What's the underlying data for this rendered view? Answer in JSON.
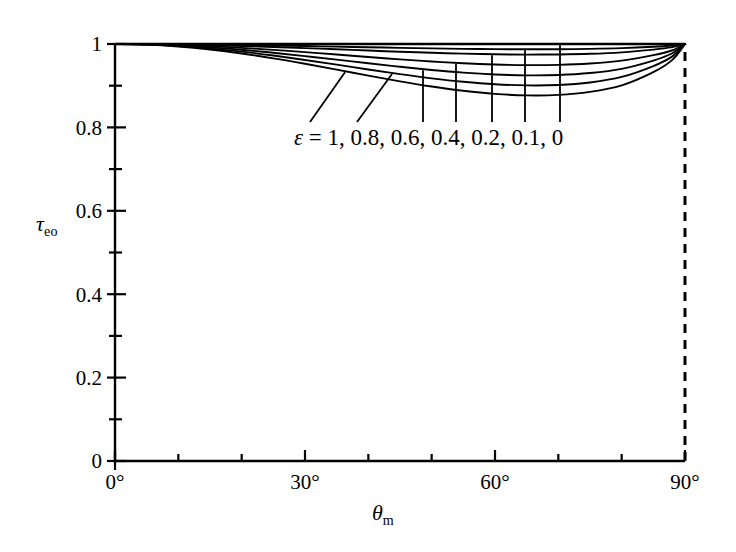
{
  "chart_data": {
    "type": "line",
    "title": "",
    "xlabel": "θ_m",
    "ylabel": "τ_eo",
    "xlabel_display": "θ",
    "xlabel_sub": "m",
    "ylabel_display": "τ",
    "ylabel_sub": "eo",
    "xlim": [
      0,
      90
    ],
    "ylim": [
      0,
      1
    ],
    "x_unit": "degrees",
    "grid": false,
    "legend_position": "inside-below-curves",
    "legend_text": "ε = 1, 0.8, 0.6, 0.4, 0.2, 0.1, 0",
    "legend_symbol": "ε",
    "legend_equals": " = ",
    "legend_values": "1, 0.8, 0.6, 0.4, 0.2, 0.1, 0",
    "x_ticks_major": [
      0,
      30,
      60,
      90
    ],
    "x_tick_labels": [
      "0°",
      "30°",
      "60°",
      "90°"
    ],
    "x_ticks_minor": [
      10,
      20,
      40,
      50,
      70,
      80
    ],
    "y_ticks_major": [
      0,
      0.2,
      0.4,
      0.6,
      0.8,
      1
    ],
    "y_tick_labels": [
      "0",
      "0.2",
      "0.4",
      "0.6",
      "0.8",
      "1"
    ],
    "y_ticks_minor": [
      0.1,
      0.3,
      0.5,
      0.7,
      0.9
    ],
    "right_boundary_style": "dashed",
    "right_boundary_x": 90,
    "line_color": "#000000",
    "x": [
      0,
      5,
      10,
      15,
      20,
      25,
      30,
      35,
      40,
      45,
      50,
      55,
      60,
      65,
      70,
      75,
      80,
      85,
      88,
      90
    ],
    "series": [
      {
        "name": "ε = 1",
        "label": "1",
        "values": [
          1.0,
          0.9985,
          0.994,
          0.9868,
          0.9772,
          0.9656,
          0.9525,
          0.9385,
          0.9243,
          0.9105,
          0.8981,
          0.8878,
          0.8804,
          0.8768,
          0.8779,
          0.8852,
          0.9008,
          0.9325,
          0.962,
          1.0
        ]
      },
      {
        "name": "ε = 0.8",
        "label": "0.8",
        "values": [
          1.0,
          0.9988,
          0.9952,
          0.9894,
          0.9816,
          0.9723,
          0.9617,
          0.9504,
          0.9389,
          0.9278,
          0.9177,
          0.9094,
          0.9035,
          0.9007,
          0.9017,
          0.9078,
          0.921,
          0.9471,
          0.9703,
          1.0
        ]
      },
      {
        "name": "ε = 0.6",
        "label": "0.6",
        "values": [
          1.0,
          0.9991,
          0.9964,
          0.992,
          0.9861,
          0.979,
          0.971,
          0.9624,
          0.9537,
          0.9453,
          0.9376,
          0.9313,
          0.9269,
          0.9248,
          0.9256,
          0.9303,
          0.9404,
          0.9602,
          0.9778,
          1.0
        ]
      },
      {
        "name": "ε = 0.4",
        "label": "0.4",
        "values": [
          1.0,
          0.9994,
          0.9976,
          0.9947,
          0.9907,
          0.9859,
          0.9805,
          0.9747,
          0.9688,
          0.9632,
          0.958,
          0.9537,
          0.9508,
          0.9494,
          0.95,
          0.9532,
          0.96,
          0.9732,
          0.985,
          1.0
        ]
      },
      {
        "name": "ε = 0.2",
        "label": "0.2",
        "values": [
          1.0,
          0.9997,
          0.9988,
          0.9973,
          0.9953,
          0.9929,
          0.9902,
          0.9873,
          0.9843,
          0.9815,
          0.979,
          0.9768,
          0.9753,
          0.9746,
          0.975,
          0.9765,
          0.98,
          0.9866,
          0.9925,
          1.0
        ]
      },
      {
        "name": "ε = 0.1",
        "label": "0.1",
        "values": [
          1.0,
          0.9999,
          0.9994,
          0.9987,
          0.9977,
          0.9965,
          0.9951,
          0.9937,
          0.9922,
          0.9908,
          0.9895,
          0.9884,
          0.9877,
          0.9873,
          0.9875,
          0.9883,
          0.99,
          0.9933,
          0.9963,
          1.0
        ]
      },
      {
        "name": "ε = 0",
        "label": "0",
        "values": [
          1.0,
          1.0,
          1.0,
          1.0,
          1.0,
          1.0,
          1.0,
          1.0,
          1.0,
          1.0,
          1.0,
          1.0,
          1.0,
          1.0,
          1.0,
          1.0,
          1.0,
          1.0,
          1.0,
          1.0
        ]
      }
    ],
    "annotations": [
      {
        "text": "1",
        "leader": "diagonal",
        "target_series": 0
      },
      {
        "text": "0.8",
        "leader": "diagonal",
        "target_series": 1
      },
      {
        "text": "0.6",
        "leader": "vertical",
        "target_series": 2
      },
      {
        "text": "0.4",
        "leader": "vertical",
        "target_series": 3
      },
      {
        "text": "0.2",
        "leader": "vertical",
        "target_series": 4
      },
      {
        "text": "0.1",
        "leader": "vertical",
        "target_series": 5
      },
      {
        "text": "0",
        "leader": "vertical",
        "target_series": 6
      }
    ]
  }
}
